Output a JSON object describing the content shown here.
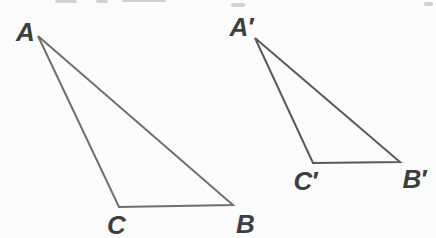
{
  "diagram": {
    "width": 436,
    "height": 238,
    "background": "#fcfcfc",
    "label_color": "#3e3e3e",
    "stroke_width": 2,
    "triangles": [
      {
        "name": "triangle-ABC",
        "stroke": "#6f6f6f",
        "vertices": [
          {
            "label": "A",
            "x": 38,
            "y": 36,
            "label_x": 25,
            "label_y": 32
          },
          {
            "label": "C",
            "x": 119,
            "y": 207,
            "label_x": 116,
            "label_y": 225
          },
          {
            "label": "B",
            "x": 233,
            "y": 205,
            "label_x": 245,
            "label_y": 224
          }
        ]
      },
      {
        "name": "triangle-A-prime-B-prime-C-prime",
        "stroke": "#595959",
        "vertices": [
          {
            "label": "A′",
            "x": 255,
            "y": 38,
            "label_x": 241,
            "label_y": 27
          },
          {
            "label": "C′",
            "x": 313,
            "y": 163,
            "label_x": 305,
            "label_y": 181
          },
          {
            "label": "B′",
            "x": 400,
            "y": 162,
            "label_x": 414,
            "label_y": 179
          }
        ]
      }
    ],
    "artifacts": [
      {
        "x": 55,
        "y": 0,
        "w": 22,
        "h": 3
      },
      {
        "x": 96,
        "y": 0,
        "w": 12,
        "h": 3
      },
      {
        "x": 122,
        "y": 0,
        "w": 44,
        "h": 2
      },
      {
        "x": 231,
        "y": 3,
        "w": 14,
        "h": 4
      },
      {
        "x": 424,
        "y": 2,
        "w": 9,
        "h": 4
      }
    ]
  }
}
